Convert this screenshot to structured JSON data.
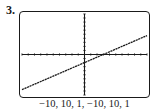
{
  "problem": {
    "number_label": "3."
  },
  "window": {
    "caption": "−10, 10, 1, −10, 10, 1",
    "xmin": -10,
    "xmax": 10,
    "xscl": 1,
    "ymin": -10,
    "ymax": 10,
    "yscl": 1
  },
  "colors": {
    "ink": "#1a1a1a",
    "background": "#ffffff"
  },
  "chart_data": {
    "type": "line",
    "title": "",
    "xlabel": "",
    "ylabel": "",
    "xlim": [
      -10,
      10
    ],
    "ylim": [
      -10,
      10
    ],
    "x_tick_step": 1,
    "y_tick_step": 1,
    "grid": false,
    "legend": null,
    "annotations": [
      "−10, 10, 1, −10, 10, 1"
    ],
    "series": [
      {
        "name": "line",
        "equation_estimate": "y = (2/3)x - 2",
        "x": [
          -10,
          -5,
          0,
          3,
          5,
          10
        ],
        "y": [
          -8.67,
          -5.33,
          -2,
          0,
          1.33,
          4.67
        ]
      }
    ],
    "intercepts": {
      "x_intercept": 3,
      "y_intercept": -2
    }
  }
}
